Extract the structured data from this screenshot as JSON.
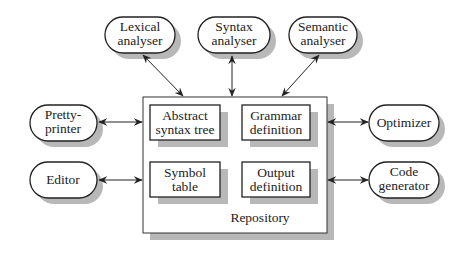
{
  "repository": {
    "label": "Repository",
    "components": [
      {
        "id": "ast",
        "line1": "Abstract",
        "line2": "syntax tree"
      },
      {
        "id": "grammar",
        "line1": "Grammar",
        "line2": "definition"
      },
      {
        "id": "symtab",
        "line1": "Symbol",
        "line2": "table"
      },
      {
        "id": "output",
        "line1": "Output",
        "line2": "definition"
      }
    ]
  },
  "tools": {
    "lexical": {
      "line1": "Lexical",
      "line2": "analyser"
    },
    "syntax": {
      "line1": "Syntax",
      "line2": "analyser"
    },
    "semantic": {
      "line1": "Semantic",
      "line2": "analyser"
    },
    "pretty": {
      "line1": "Pretty-",
      "line2": "printer"
    },
    "editor": {
      "line1": "Editor"
    },
    "optimizer": {
      "line1": "Optimizer"
    },
    "codegen": {
      "line1": "Code",
      "line2": "generator"
    }
  },
  "colors": {
    "stroke": "#222222",
    "shadow": "#b8b8b8",
    "fill": "#ffffff"
  }
}
